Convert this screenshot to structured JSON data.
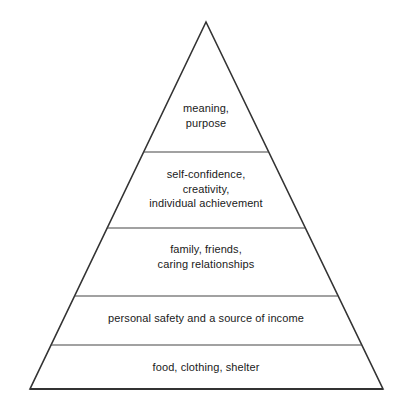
{
  "diagram": {
    "type": "pyramid",
    "title": "",
    "background_color": "#ffffff",
    "stroke_color": "#333333",
    "text_color": "#1a1a1a",
    "geometry": {
      "apex": [
        206,
        22
      ],
      "base_left": [
        30,
        389
      ],
      "base_right": [
        383,
        389
      ],
      "divider_y": [
        152,
        228,
        296,
        345
      ]
    },
    "tiers": [
      {
        "index": 5,
        "position": "top",
        "text": "meaning,\npurpose"
      },
      {
        "index": 4,
        "position": "upper-middle",
        "text": "self-confidence,\ncreativity,\nindividual achievement"
      },
      {
        "index": 3,
        "position": "middle",
        "text": "family, friends,\ncaring relationships"
      },
      {
        "index": 2,
        "position": "lower-middle",
        "text": "personal safety and a source of income"
      },
      {
        "index": 1,
        "position": "bottom",
        "text": "food, clothing, shelter"
      }
    ]
  }
}
